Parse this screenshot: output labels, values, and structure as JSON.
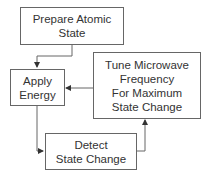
{
  "diagram": {
    "type": "flowchart",
    "nodes": [
      {
        "id": "prepare",
        "label": "Prepare Atomic\nState"
      },
      {
        "id": "apply",
        "label": "Apply\nEnergy"
      },
      {
        "id": "tune",
        "label": "Tune Microwave\nFrequency\nFor Maximum\nState Change"
      },
      {
        "id": "detect",
        "label": "Detect\nState Change"
      }
    ],
    "edges": [
      {
        "from": "prepare",
        "to": "apply"
      },
      {
        "from": "apply",
        "to": "detect"
      },
      {
        "from": "detect",
        "to": "tune"
      },
      {
        "from": "tune",
        "to": "apply"
      }
    ],
    "colors": {
      "line": "#666666",
      "text": "#333333",
      "background": "#ffffff"
    }
  }
}
